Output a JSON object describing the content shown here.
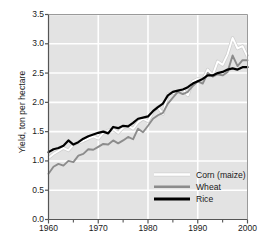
{
  "chart_data": {
    "type": "line",
    "title": "",
    "xlabel": "",
    "ylabel": "Yield, ton per hectare",
    "xlim": [
      1960,
      2000
    ],
    "ylim": [
      0.0,
      3.5
    ],
    "ytick_labels": [
      "0.0",
      "0.5",
      "1.0",
      "1.5",
      "2.0",
      "2.5",
      "3.0",
      "3.5"
    ],
    "ytick_values": [
      0.0,
      0.5,
      1.0,
      1.5,
      2.0,
      2.5,
      3.0,
      3.5
    ],
    "xtick_labels": [
      "1960",
      "1970",
      "1980",
      "1990",
      "2000"
    ],
    "xtick_values": [
      1960,
      1970,
      1980,
      1990,
      2000
    ],
    "xminor_ticks": [
      1965,
      1975,
      1985,
      1995
    ],
    "grid": true,
    "grid_color": "#ffffff",
    "plot_background": "#e3e3e3",
    "legend_position": "bottom-right",
    "x": [
      1960,
      1961,
      1962,
      1963,
      1964,
      1965,
      1966,
      1967,
      1968,
      1969,
      1970,
      1971,
      1972,
      1973,
      1974,
      1975,
      1976,
      1977,
      1978,
      1979,
      1980,
      1981,
      1982,
      1983,
      1984,
      1985,
      1986,
      1987,
      1988,
      1989,
      1990,
      1991,
      1992,
      1993,
      1994,
      1995,
      1996,
      1997,
      1998,
      1999,
      2000
    ],
    "series": [
      {
        "name": "Corn (maize)",
        "color": "#ffffff",
        "values": [
          1.05,
          1.12,
          1.17,
          1.22,
          1.18,
          1.28,
          1.31,
          1.34,
          1.38,
          1.42,
          1.38,
          1.48,
          1.52,
          1.54,
          1.48,
          1.57,
          1.6,
          1.55,
          1.66,
          1.72,
          1.68,
          1.84,
          1.92,
          1.8,
          2.14,
          2.16,
          2.18,
          2.22,
          2.12,
          2.36,
          2.4,
          2.38,
          2.56,
          2.46,
          2.7,
          2.64,
          2.82,
          3.1,
          2.92,
          2.96,
          2.78
        ]
      },
      {
        "name": "Wheat",
        "color": "#8c8c8c",
        "values": [
          0.78,
          0.9,
          0.95,
          0.92,
          1.0,
          0.98,
          1.09,
          1.12,
          1.2,
          1.19,
          1.24,
          1.29,
          1.28,
          1.35,
          1.3,
          1.35,
          1.41,
          1.37,
          1.55,
          1.49,
          1.6,
          1.72,
          1.78,
          1.82,
          1.98,
          2.08,
          2.18,
          2.14,
          2.18,
          2.28,
          2.36,
          2.32,
          2.5,
          2.44,
          2.48,
          2.46,
          2.52,
          2.8,
          2.62,
          2.72,
          2.72
        ]
      },
      {
        "name": "Rice",
        "color": "#000000",
        "values": [
          1.15,
          1.2,
          1.22,
          1.26,
          1.35,
          1.28,
          1.32,
          1.38,
          1.42,
          1.45,
          1.48,
          1.5,
          1.47,
          1.58,
          1.56,
          1.6,
          1.59,
          1.65,
          1.72,
          1.74,
          1.76,
          1.85,
          1.92,
          1.98,
          2.12,
          2.18,
          2.2,
          2.22,
          2.26,
          2.32,
          2.36,
          2.4,
          2.46,
          2.46,
          2.5,
          2.52,
          2.56,
          2.58,
          2.56,
          2.6,
          2.6
        ]
      }
    ]
  }
}
